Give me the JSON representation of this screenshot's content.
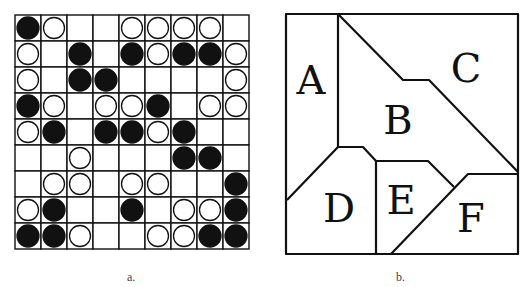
{
  "panel_a": {
    "caption": "a.",
    "rows": 9,
    "cols": 9,
    "legend": {
      "B": "black stone",
      "W": "white stone",
      ".": "empty"
    },
    "board": [
      "BW..WWWW.",
      "W.B.BWBBW",
      "W.BB....W",
      "BW.WWB.WW",
      "WB.BBWB..",
      "..W...BB.",
      ".WW.WW..B",
      "WB..B.WWB",
      "BBW..WWBB"
    ]
  },
  "panel_b": {
    "caption": "b.",
    "regions": [
      {
        "label": "A",
        "x": 311,
        "y": 80
      },
      {
        "label": "B",
        "x": 398,
        "y": 120
      },
      {
        "label": "C",
        "x": 466,
        "y": 68
      },
      {
        "label": "D",
        "x": 339,
        "y": 208
      },
      {
        "label": "E",
        "x": 401,
        "y": 200
      },
      {
        "label": "F",
        "x": 471,
        "y": 218
      }
    ]
  },
  "colors": {
    "line": "#111111",
    "black_stone": "#111111",
    "white_stone": "#ffffff"
  }
}
